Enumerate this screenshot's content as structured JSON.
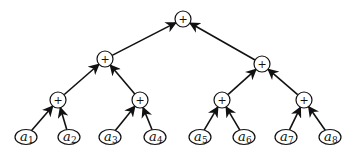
{
  "diagram": {
    "type": "binary-reduction-tree",
    "operator": "+",
    "nodes": [
      {
        "id": "root",
        "label": "+",
        "x": 183,
        "y": 19
      },
      {
        "id": "n2l",
        "label": "+",
        "x": 105,
        "y": 59
      },
      {
        "id": "n2r",
        "label": "+",
        "x": 262,
        "y": 64
      },
      {
        "id": "n3a",
        "label": "+",
        "x": 58,
        "y": 100
      },
      {
        "id": "n3b",
        "label": "+",
        "x": 140,
        "y": 100
      },
      {
        "id": "n3c",
        "label": "+",
        "x": 222,
        "y": 100
      },
      {
        "id": "n3d",
        "label": "+",
        "x": 304,
        "y": 100
      }
    ],
    "leaves": [
      {
        "id": "a1",
        "base": "a",
        "sub": "1",
        "x": 26,
        "y": 137
      },
      {
        "id": "a2",
        "base": "a",
        "sub": "2",
        "x": 69,
        "y": 137
      },
      {
        "id": "a3",
        "base": "a",
        "sub": "3",
        "x": 110,
        "y": 137
      },
      {
        "id": "a4",
        "base": "a",
        "sub": "4",
        "x": 155,
        "y": 137
      },
      {
        "id": "a5",
        "base": "a",
        "sub": "5",
        "x": 200,
        "y": 137
      },
      {
        "id": "a6",
        "base": "a",
        "sub": "6",
        "x": 244,
        "y": 137
      },
      {
        "id": "a7",
        "base": "a",
        "sub": "7",
        "x": 286,
        "y": 137
      },
      {
        "id": "a8",
        "base": "a",
        "sub": "8",
        "x": 330,
        "y": 137
      }
    ],
    "edges": [
      {
        "from": "n2l",
        "to": "root"
      },
      {
        "from": "n2r",
        "to": "root"
      },
      {
        "from": "n3a",
        "to": "n2l"
      },
      {
        "from": "n3b",
        "to": "n2l"
      },
      {
        "from": "n3c",
        "to": "n2r"
      },
      {
        "from": "n3d",
        "to": "n2r"
      },
      {
        "from": "a1",
        "to": "n3a"
      },
      {
        "from": "a2",
        "to": "n3a"
      },
      {
        "from": "a3",
        "to": "n3b"
      },
      {
        "from": "a4",
        "to": "n3b"
      },
      {
        "from": "a5",
        "to": "n3c"
      },
      {
        "from": "a6",
        "to": "n3c"
      },
      {
        "from": "a7",
        "to": "n3d"
      },
      {
        "from": "a8",
        "to": "n3d"
      }
    ],
    "colors": {
      "stroke": "#111111",
      "background": "#ffffff"
    }
  }
}
